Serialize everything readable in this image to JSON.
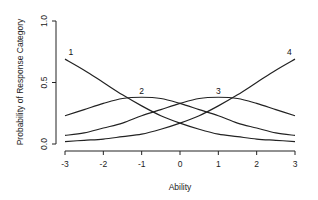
{
  "chart_data": {
    "type": "line",
    "title": "",
    "xlabel": "Ability",
    "ylabel": "Probability of Response Category",
    "xlim": [
      -3,
      3
    ],
    "ylim": [
      0,
      1
    ],
    "x_ticks": [
      "-3",
      "-2",
      "-1",
      "0",
      "1",
      "2",
      "3"
    ],
    "y_ticks": [
      "0.0",
      "0.5",
      "1.0"
    ],
    "grid": false,
    "legend": "none (curves labeled inline)",
    "x": [
      -3,
      -2.5,
      -2,
      -1.5,
      -1,
      -0.5,
      0,
      0.5,
      1,
      1.5,
      2,
      2.5,
      3
    ],
    "series": [
      {
        "name": "1",
        "values": [
          0.69,
          0.6,
          0.5,
          0.4,
          0.31,
          0.23,
          0.17,
          0.12,
          0.08,
          0.06,
          0.04,
          0.03,
          0.02
        ]
      },
      {
        "name": "2",
        "values": [
          0.23,
          0.28,
          0.33,
          0.37,
          0.38,
          0.37,
          0.33,
          0.28,
          0.23,
          0.17,
          0.13,
          0.09,
          0.07
        ]
      },
      {
        "name": "3",
        "values": [
          0.07,
          0.09,
          0.13,
          0.17,
          0.23,
          0.28,
          0.33,
          0.37,
          0.38,
          0.37,
          0.33,
          0.28,
          0.23
        ]
      },
      {
        "name": "4",
        "values": [
          0.02,
          0.03,
          0.04,
          0.06,
          0.08,
          0.12,
          0.17,
          0.23,
          0.31,
          0.4,
          0.5,
          0.6,
          0.69
        ]
      }
    ],
    "inline_labels": [
      {
        "text": "1",
        "x": -2.85,
        "y": 0.72
      },
      {
        "text": "2",
        "x": -1.0,
        "y": 0.41
      },
      {
        "text": "3",
        "x": 1.0,
        "y": 0.41
      },
      {
        "text": "4",
        "x": 2.85,
        "y": 0.72
      }
    ]
  }
}
